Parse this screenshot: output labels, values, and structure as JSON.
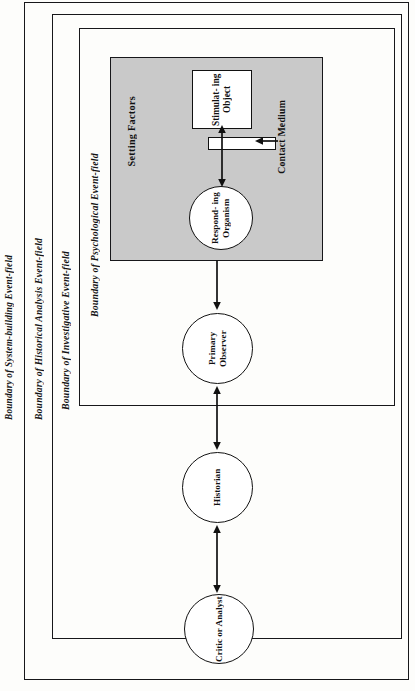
{
  "diagram": {
    "frames": [
      {
        "id": "system",
        "label": "Boundary of System-building Event-field"
      },
      {
        "id": "historical",
        "label": "Boundary of Historical Analysis Event-field"
      },
      {
        "id": "investigative",
        "label": "Boundary of Investigative Event-field"
      },
      {
        "id": "psychological",
        "label": "Boundary of Psychological Event-field"
      }
    ],
    "shaded_field": {
      "label": "Setting Factors",
      "fill": "#c9c9c9"
    },
    "nodes": [
      {
        "id": "stimulating-object",
        "shape": "rect",
        "label": "Stimulat-\ning\nObject"
      },
      {
        "id": "contact-medium",
        "shape": "bar",
        "label": "Contact Medium"
      },
      {
        "id": "responding-organism",
        "shape": "circle",
        "label": "Respond-\ning\nOrganism"
      },
      {
        "id": "primary-observer",
        "shape": "circle",
        "label": "Primary\nObserver"
      },
      {
        "id": "historian",
        "shape": "circle",
        "label": "Historian"
      },
      {
        "id": "critic-or-analyst",
        "shape": "circle",
        "label": "Critic\nor\nAnalyst"
      }
    ],
    "connectors": [
      {
        "id": "organism-object",
        "from": "responding-organism",
        "to": "stimulating-object",
        "style": "double-headed"
      },
      {
        "id": "medium-pointer",
        "from": "contact-medium-label",
        "to": "contact-medium",
        "style": "single-headed"
      },
      {
        "id": "field-to-primary",
        "from": "psychological-field",
        "to": "primary-observer",
        "style": "single-headed"
      },
      {
        "id": "primary-to-historian",
        "from": "primary-observer",
        "to": "historian",
        "style": "double-headed"
      },
      {
        "id": "historian-to-critic",
        "from": "historian",
        "to": "critic-or-analyst",
        "style": "double-headed"
      }
    ],
    "colors": {
      "ink": "#17171a",
      "shade": "#c9c9c9",
      "paper": "#fdfdfb"
    }
  }
}
